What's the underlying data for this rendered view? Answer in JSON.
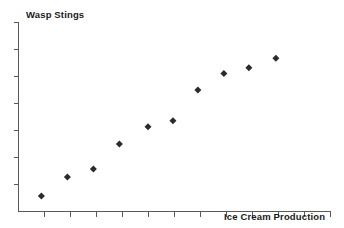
{
  "chart_data": {
    "type": "scatter",
    "title": "",
    "xlabel": "Ice Cream Production",
    "ylabel": "Wasp Stings",
    "grid": false,
    "legend": false,
    "axis_tick_labels": {
      "x": [],
      "y": []
    },
    "xlim": [
      0,
      12
    ],
    "ylim": [
      0,
      7
    ],
    "x_tick_count": 12,
    "y_tick_count": 7,
    "marker": {
      "shape": "diamond",
      "color": "#2b2b2b",
      "size": 7
    },
    "axis_color": "#595959",
    "series": [
      {
        "name": "observations",
        "points": [
          {
            "x": 0.88,
            "y": 0.57
          },
          {
            "x": 1.88,
            "y": 1.28
          },
          {
            "x": 2.88,
            "y": 1.57
          },
          {
            "x": 3.88,
            "y": 2.5
          },
          {
            "x": 4.98,
            "y": 3.14
          },
          {
            "x": 5.94,
            "y": 3.36
          },
          {
            "x": 6.9,
            "y": 4.5
          },
          {
            "x": 7.9,
            "y": 5.11
          },
          {
            "x": 8.86,
            "y": 5.32
          },
          {
            "x": 9.9,
            "y": 5.68
          }
        ]
      }
    ]
  },
  "labels": {
    "y_axis_title": "Wasp Stings",
    "x_axis_title": "Ice Cream Production"
  }
}
